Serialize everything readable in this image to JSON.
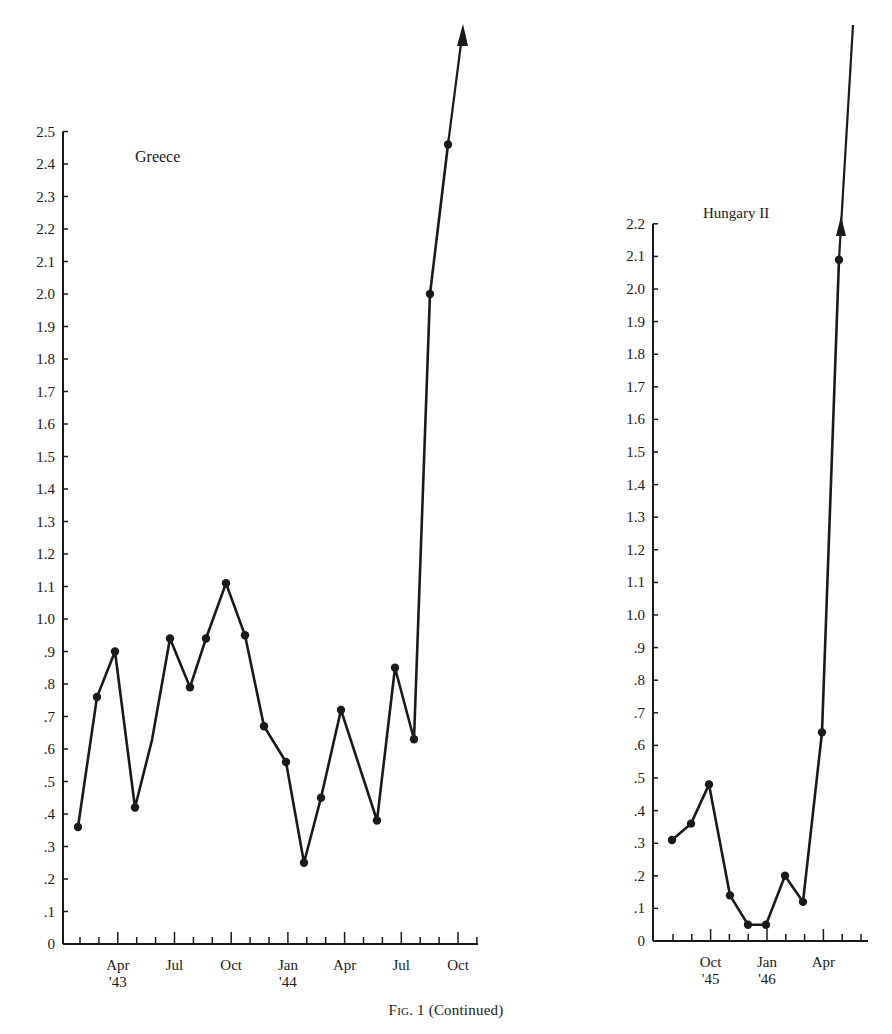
{
  "caption": {
    "fig_label": "Fig.",
    "fig_number": "1",
    "suffix": "(Continued)"
  },
  "style": {
    "ink_color": "#1a1a1a",
    "background": "#ffffff"
  },
  "chart_data": [
    {
      "type": "line",
      "title": "Greece",
      "xlabel": "",
      "ylabel": "",
      "ylim": [
        0,
        2.5
      ],
      "ytick_labels": [
        "0",
        ".1",
        ".2",
        ".3",
        ".4",
        ".5",
        ".6",
        ".7",
        ".8",
        ".9",
        "1.0",
        "1.1",
        "1.2",
        "1.3",
        "1.4",
        "1.5",
        "1.6",
        "1.7",
        "1.8",
        "1.9",
        "2.0",
        "2.1",
        "2.2",
        "2.3",
        "2.4",
        "2.5"
      ],
      "xtick_labels": [
        {
          "label": "Apr",
          "sub": "'43"
        },
        {
          "label": "Jul",
          "sub": ""
        },
        {
          "label": "Oct",
          "sub": ""
        },
        {
          "label": "Jan",
          "sub": "'44"
        },
        {
          "label": "Apr",
          "sub": ""
        },
        {
          "label": "Jul",
          "sub": ""
        },
        {
          "label": "Oct",
          "sub": ""
        }
      ],
      "grid": false,
      "legend": null,
      "arrow_off_scale": true,
      "x": [
        "Feb '43",
        "Mar '43",
        "Apr '43",
        "May '43",
        "Jul '43",
        "Aug '43",
        "Sep '43",
        "Oct '43",
        "Nov '43",
        "Dec '43",
        "Jan '44",
        "Feb '44",
        "Mar '44",
        "Apr '44",
        "Jun '44",
        "Jul '44",
        "Aug '44",
        "Sep '44",
        "Oct '44"
      ],
      "values": [
        0.36,
        0.76,
        0.9,
        0.42,
        0.94,
        0.79,
        0.94,
        1.11,
        0.95,
        0.67,
        0.56,
        0.25,
        0.45,
        0.72,
        0.38,
        0.85,
        0.63,
        2.0,
        2.46
      ],
      "note": "Line continues off-scale upward with an arrowhead after Oct '44"
    },
    {
      "type": "line",
      "title": "Hungary II",
      "xlabel": "",
      "ylabel": "",
      "ylim": [
        0,
        2.2
      ],
      "ytick_labels": [
        "0",
        ".1",
        ".2",
        ".3",
        ".4",
        ".5",
        ".6",
        ".7",
        ".8",
        ".9",
        "1.0",
        "1.1",
        "1.2",
        "1.3",
        "1.4",
        "1.5",
        "1.6",
        "1.7",
        "1.8",
        "1.9",
        "2.0",
        "2.1",
        "2.2"
      ],
      "xtick_labels": [
        {
          "label": "Oct",
          "sub": "'45"
        },
        {
          "label": "Jan",
          "sub": "'46"
        },
        {
          "label": "Apr",
          "sub": ""
        }
      ],
      "grid": false,
      "legend": null,
      "arrow_off_scale": true,
      "x": [
        "Aug '45",
        "Sep '45",
        "Oct '45",
        "Nov '45",
        "Dec '45",
        "Jan '46",
        "Feb '46",
        "Mar '46",
        "Apr '46",
        "May '46"
      ],
      "values": [
        0.31,
        0.36,
        0.48,
        0.14,
        0.05,
        0.05,
        0.2,
        0.12,
        0.64,
        2.09
      ],
      "note": "Line continues off-scale upward with an arrowhead after May '46"
    }
  ]
}
